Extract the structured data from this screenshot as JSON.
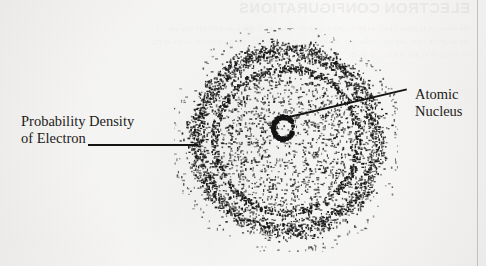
{
  "figure": {
    "type": "atomic-orbital-probability-density-diagram",
    "background_color": "#f4f3f1",
    "ink_color": "#141414"
  },
  "labels": {
    "probability_density": {
      "line1": "Probability Density",
      "line2": "of Electron"
    },
    "atomic_nucleus": {
      "line1": "Atomic",
      "line2": "Nucleus"
    }
  },
  "leaders": {
    "left_name": "leader-line-probability-density",
    "right_name": "leader-line-atomic-nucleus"
  },
  "bleed_through": {
    "heading": "ELECTRON CONFIGURATIONS",
    "body": "the electron is most likely to be found within this region of space around the nucleus of the atom and the density of the dots in the drawing represents the probability of locating an electron at any particular point"
  },
  "cloud": {
    "center_x": 112,
    "center_y": 112,
    "outer_radius": 108,
    "shell_boundary_radius": 72,
    "nucleus_ring": {
      "cx": 109,
      "cy": 100,
      "rx": 10,
      "ry": 11
    },
    "dot_color": "#151515",
    "dot_counts": {
      "outer_shell": 2600,
      "inner_shell": 1150,
      "halo": 520
    }
  }
}
